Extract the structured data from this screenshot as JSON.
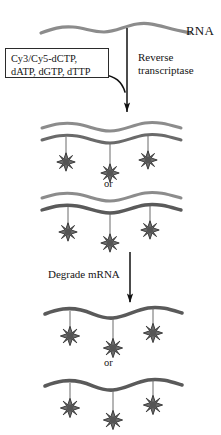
{
  "figure": {
    "type": "diagram",
    "colors": {
      "rna_strand": "#8c8c8c",
      "cdna_strand": "#5a5a5a",
      "fluorophore": "#6e6e6e",
      "fluorophore_outline": "#2f2f2f",
      "arrow": "#111111",
      "box_border": "#2b2b2b",
      "text": "#151515",
      "background": "#ffffff"
    }
  },
  "labels": {
    "rna": "RNA",
    "enzyme_line1": "Reverse",
    "enzyme_line2": "transcriptase",
    "degrade": "Degrade mRNA",
    "or_upper": "or",
    "or_lower": "or"
  },
  "reagents": {
    "line1": "Cy3/Cy5-dCTP,",
    "line2": "dATP, dGTP, dTTP"
  },
  "steps": [
    {
      "id": "step-1",
      "name": "reverse-transcription",
      "label_line1": "Reverse",
      "label_line2": "transcriptase"
    },
    {
      "id": "step-2",
      "name": "degrade-mrna",
      "label": "Degrade mRNA"
    }
  ],
  "panels": [
    {
      "id": "panel-duplex-a",
      "kind": "duplex",
      "strands": 2,
      "fluorophore_count": 3,
      "label_after": "or"
    },
    {
      "id": "panel-duplex-b",
      "kind": "duplex",
      "strands": 2,
      "fluorophore_count": 3,
      "label_after": ""
    },
    {
      "id": "panel-single-a",
      "kind": "single",
      "strands": 1,
      "fluorophore_count": 3,
      "label_after": "or"
    },
    {
      "id": "panel-single-b",
      "kind": "single",
      "strands": 1,
      "fluorophore_count": 3,
      "label_after": ""
    }
  ],
  "fluorophore": {
    "shape": "8-point-star",
    "points": 8,
    "meaning": "Cy3/Cy5 dye incorporated into cDNA"
  }
}
